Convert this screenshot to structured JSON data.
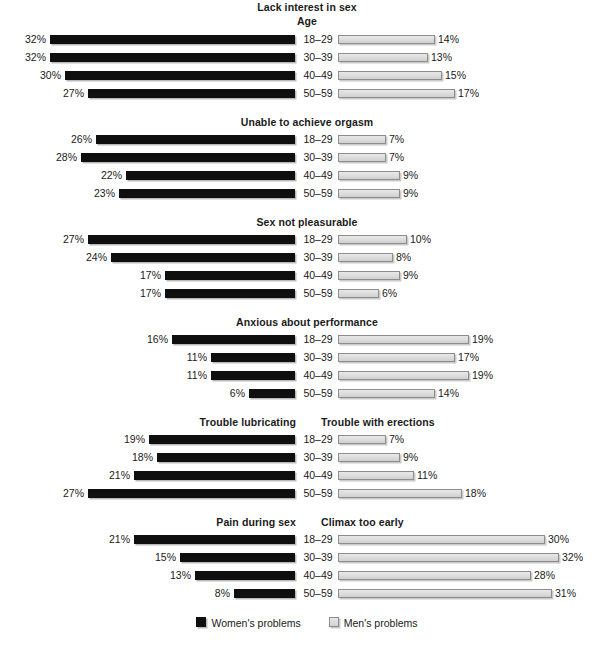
{
  "chart_data": {
    "type": "bar",
    "title": "",
    "subtitle": "Age",
    "orientation": "horizontal-diverging",
    "categories": [
      "18–29",
      "30–39",
      "40–49",
      "50–59"
    ],
    "xlabel": "",
    "ylabel": "",
    "unit": "%",
    "grid": false,
    "legend_position": "bottom-center",
    "legend": [
      {
        "name": "Women's problems",
        "color": "#100f0f"
      },
      {
        "name": "Men's problems",
        "color": "#dcdcdc"
      }
    ],
    "px_per_percent_left": 7.66,
    "px_per_percent_right": 6.9,
    "panels": [
      {
        "left_title": "Lack interest in sex",
        "right_title": "",
        "center_title": "Lack interest in sex",
        "subtitle": "Age",
        "women": [
          32,
          32,
          30,
          27
        ],
        "men": [
          14,
          13,
          15,
          17
        ]
      },
      {
        "left_title": "Unable to achieve orgasm",
        "right_title": "",
        "center_title": "Unable to achieve orgasm",
        "subtitle": "",
        "women": [
          26,
          28,
          22,
          23
        ],
        "men": [
          7,
          7,
          9,
          9
        ]
      },
      {
        "left_title": "Sex not pleasurable",
        "right_title": "",
        "center_title": "Sex not pleasurable",
        "subtitle": "",
        "women": [
          27,
          24,
          17,
          17
        ],
        "men": [
          10,
          8,
          9,
          6
        ]
      },
      {
        "left_title": "Anxious about performance",
        "right_title": "",
        "center_title": "Anxious about performance",
        "subtitle": "",
        "women": [
          16,
          11,
          11,
          6
        ],
        "men": [
          19,
          17,
          19,
          14
        ]
      },
      {
        "left_title": "Trouble lubricating",
        "right_title": "Trouble with erections",
        "center_title": "",
        "subtitle": "",
        "women": [
          19,
          18,
          21,
          27
        ],
        "men": [
          7,
          9,
          11,
          18
        ]
      },
      {
        "left_title": "Pain during sex",
        "right_title": "Climax too early",
        "center_title": "",
        "subtitle": "",
        "women": [
          21,
          15,
          13,
          8
        ],
        "men": [
          30,
          32,
          28,
          31
        ]
      }
    ]
  },
  "legend": {
    "women_label": "Women's problems",
    "men_label": "Men's problems"
  }
}
